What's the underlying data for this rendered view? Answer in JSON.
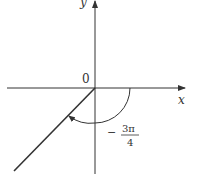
{
  "diagram": {
    "type": "angle-in-standard-position",
    "axes": {
      "x_label": "x",
      "y_label": "y",
      "origin_label": "0"
    },
    "angle": {
      "numerator": "3π",
      "denominator": "4",
      "sign": "−",
      "direction": "clockwise",
      "description": "negative angle of -3π/4 measured clockwise from positive x-axis"
    },
    "colors": {
      "stroke": "#333333",
      "background": "#ffffff"
    }
  }
}
